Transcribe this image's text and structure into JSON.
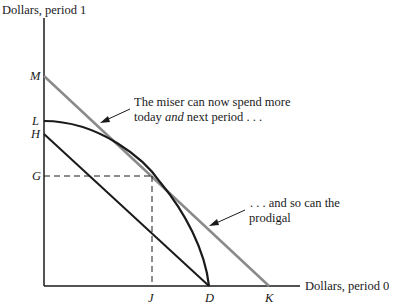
{
  "axes": {
    "y_label": "Dollars, period 1",
    "x_label": "Dollars, period 0"
  },
  "points": {
    "M": "M",
    "L": "L",
    "H": "H",
    "G": "G",
    "J": "J",
    "D": "D",
    "K": "K"
  },
  "annotations": {
    "miser_line1": "The miser can now spend more",
    "miser_line2_pre": "today ",
    "miser_line2_em": "and",
    "miser_line2_post": " next period . . .",
    "prodigal_line1": ". . . and so can the",
    "prodigal_line2": "prodigal"
  },
  "colors": {
    "ink": "#1a1a1a",
    "gray_line": "#8a8a8a"
  }
}
